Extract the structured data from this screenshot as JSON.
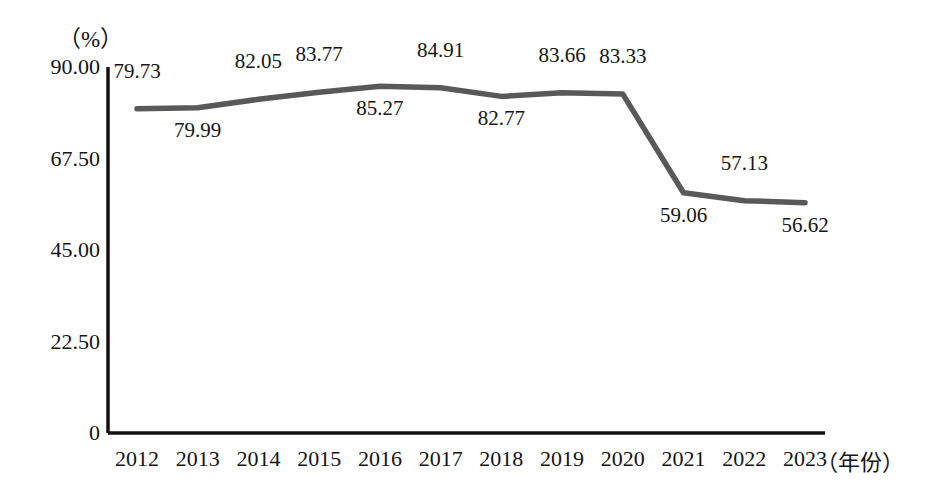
{
  "chart_data": {
    "type": "line",
    "title": "",
    "xlabel": "（年份）",
    "ylabel": "（%）",
    "categories": [
      "2012",
      "2013",
      "2014",
      "2015",
      "2016",
      "2017",
      "2018",
      "2019",
      "2020",
      "2021",
      "2022",
      "2023"
    ],
    "values": [
      79.73,
      79.99,
      82.05,
      83.77,
      85.27,
      84.91,
      82.77,
      83.66,
      83.33,
      59.06,
      57.13,
      56.62
    ],
    "series": [
      {
        "name": "",
        "values": [
          79.73,
          79.99,
          82.05,
          83.77,
          85.27,
          84.91,
          82.77,
          83.66,
          83.33,
          59.06,
          57.13,
          56.62
        ]
      }
    ],
    "point_labels": [
      {
        "text": "79.73",
        "position": "above"
      },
      {
        "text": "79.99",
        "position": "below"
      },
      {
        "text": "82.05",
        "position": "above"
      },
      {
        "text": "83.77",
        "position": "above"
      },
      {
        "text": "85.27",
        "position": "below"
      },
      {
        "text": "84.91",
        "position": "above"
      },
      {
        "text": "82.77",
        "position": "below"
      },
      {
        "text": "83.66",
        "position": "above"
      },
      {
        "text": "83.33",
        "position": "above"
      },
      {
        "text": "59.06",
        "position": "below"
      },
      {
        "text": "57.13",
        "position": "above"
      },
      {
        "text": "56.62",
        "position": "below"
      }
    ],
    "ytick_labels": [
      "0",
      "22.50",
      "45.00",
      "67.50",
      "90.00"
    ],
    "ytick_values": [
      0,
      22.5,
      45,
      67.5,
      90
    ],
    "ylim": [
      0,
      90
    ],
    "grid": false,
    "legend": "none",
    "line_color": "#595959",
    "axis_color": "#111111"
  },
  "axis": {
    "unit_label": "（%）",
    "x_title": "（年份）"
  }
}
